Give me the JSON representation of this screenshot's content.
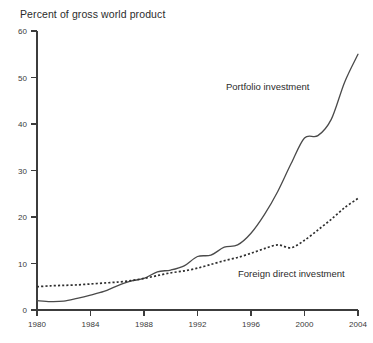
{
  "chart_data": {
    "type": "line",
    "title": "Percent of gross world product",
    "xlabel": "",
    "ylabel": "Percent of gross world product",
    "xlim": [
      1980,
      2004
    ],
    "ylim": [
      0,
      60
    ],
    "grid": false,
    "legend_position": "inline-annotations",
    "xticks": [
      1980,
      1984,
      1988,
      1992,
      1996,
      2000,
      2004
    ],
    "xtick_labels": [
      "1980",
      "1984",
      "1988",
      "1992",
      "1996",
      "2000",
      "2004"
    ],
    "yticks": [
      0,
      10,
      20,
      30,
      40,
      50,
      60
    ],
    "ytick_labels": [
      "0",
      "10",
      "20",
      "30",
      "40",
      "50",
      "60"
    ],
    "x": [
      1980,
      1981,
      1982,
      1983,
      1984,
      1985,
      1986,
      1987,
      1988,
      1989,
      1990,
      1991,
      1992,
      1993,
      1994,
      1995,
      1996,
      1997,
      1998,
      1999,
      2000,
      2001,
      2002,
      2003,
      2004
    ],
    "series": [
      {
        "name": "Portfolio investment",
        "style": "solid",
        "color": "#4a4a4a",
        "label_text": "Portfolio investment",
        "values": [
          2.0,
          1.8,
          1.9,
          2.5,
          3.2,
          4.0,
          5.2,
          6.2,
          6.8,
          8.2,
          8.6,
          9.5,
          11.5,
          11.8,
          13.5,
          14.0,
          16.5,
          20.5,
          25.5,
          31.5,
          37.0,
          37.5,
          41.0,
          49.0,
          55.0
        ]
      },
      {
        "name": "Foreign direct investment",
        "style": "dotted",
        "color": "#2e2e2e",
        "label_text": "Foreign direct investment",
        "values": [
          5.0,
          5.2,
          5.3,
          5.4,
          5.6,
          5.8,
          6.0,
          6.3,
          6.8,
          7.4,
          8.0,
          8.4,
          9.0,
          9.8,
          10.6,
          11.3,
          12.2,
          13.2,
          14.0,
          13.4,
          15.0,
          17.2,
          19.5,
          22.0,
          24.0
        ]
      }
    ],
    "annotations": [
      {
        "text": "Portfolio investment",
        "x_px": 226,
        "y_px": 90
      },
      {
        "text": "Foreign direct investment",
        "x_px": 238,
        "y_px": 277
      }
    ]
  }
}
